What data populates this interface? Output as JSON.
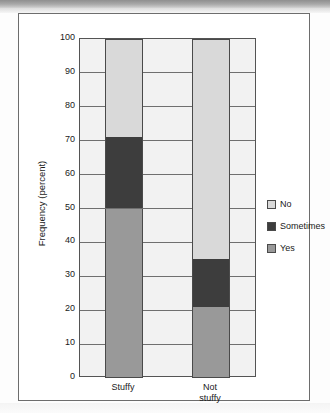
{
  "figure": {
    "y_axis_title": "Frequency (percent)"
  },
  "chart_data": {
    "type": "bar",
    "subtype": "stacked-100-percent",
    "title": "",
    "xlabel": "",
    "ylabel": "Frequency (percent)",
    "ylim": [
      0,
      100
    ],
    "yticks": [
      0,
      10,
      20,
      30,
      40,
      50,
      60,
      70,
      80,
      90,
      100
    ],
    "ytick_labels": [
      "0",
      "10",
      "20",
      "30",
      "40",
      "50",
      "60",
      "70",
      "80",
      "90",
      "100"
    ],
    "grid": true,
    "legend_position": "right",
    "categories": [
      "Stuffy",
      "Not stuffy"
    ],
    "category_label_lines": [
      [
        "Stuffy"
      ],
      [
        "Not",
        "stuffy"
      ]
    ],
    "series": [
      {
        "name": "Yes",
        "color": "#999999",
        "values": [
          50,
          21
        ]
      },
      {
        "name": "Sometimes",
        "color": "#3d3d3d",
        "values": [
          21,
          14
        ]
      },
      {
        "name": "No",
        "color": "#d9d9d9",
        "values": [
          29,
          65
        ]
      }
    ],
    "stack_boundaries": {
      "Stuffy": {
        "yes_top": 50,
        "sometimes_top": 71,
        "no_top": 100
      },
      "Not stuffy": {
        "yes_top": 21,
        "sometimes_top": 35,
        "no_top": 100
      }
    },
    "legend_entries": [
      {
        "label": "No",
        "color": "#d9d9d9"
      },
      {
        "label": "Sometimes",
        "color": "#3d3d3d"
      },
      {
        "label": "Yes",
        "color": "#999999"
      }
    ],
    "plot_background": "#f2f2f2",
    "axis_color": "#545454",
    "gridline_color": "#6f6f6f"
  }
}
